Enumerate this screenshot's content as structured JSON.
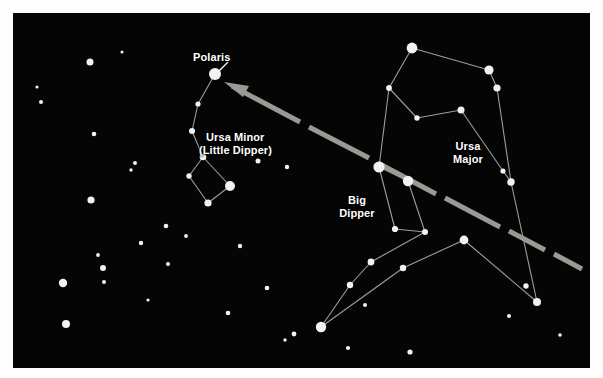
{
  "figure": {
    "type": "star-chart",
    "title_visible": false,
    "background_color": "#050505",
    "page_color": "#fdfdfb",
    "star_color": "#f2f2f0",
    "line_color": "#b9b9b4",
    "pointer_color": "#9a9a95",
    "label_color": "#ffffff",
    "frame": {
      "x": 13,
      "y": 13,
      "width": 577,
      "height": 355
    }
  },
  "labels": [
    {
      "id": "polaris",
      "text": "Polaris",
      "x": 193,
      "y": 51,
      "align": "left"
    },
    {
      "id": "ursa-minor",
      "text": "Ursa Minor",
      "x": 206,
      "y": 131,
      "align": "left"
    },
    {
      "id": "little-dipper",
      "text": "(Little Dipper)",
      "x": 199,
      "y": 144,
      "align": "left"
    },
    {
      "id": "big-dipper-1",
      "text": "Big",
      "x": 357,
      "y": 194,
      "align": "center"
    },
    {
      "id": "big-dipper-2",
      "text": "Dipper",
      "x": 357,
      "y": 207,
      "align": "center"
    },
    {
      "id": "ursa-major-1",
      "text": "Ursa",
      "x": 468,
      "y": 140,
      "align": "center"
    },
    {
      "id": "ursa-major-2",
      "text": "Major",
      "x": 468,
      "y": 153,
      "align": "center"
    }
  ],
  "leader_lines": [
    {
      "id": "polaris-leader",
      "x1": 228,
      "y1": 62,
      "x2": 217,
      "y2": 73
    }
  ],
  "pointer_arrow": {
    "id": "pointer-line",
    "description": "dashed arrow from Big Dipper pointer stars to Polaris",
    "tip": {
      "x": 224,
      "y": 82
    },
    "tail": {
      "x": 578,
      "y": 268
    },
    "dashes": [
      {
        "x1": 232,
        "y1": 86,
        "x2": 300,
        "y2": 122
      },
      {
        "x1": 309,
        "y1": 127,
        "x2": 369,
        "y2": 158
      },
      {
        "x1": 378,
        "y1": 163,
        "x2": 436,
        "y2": 194
      },
      {
        "x1": 445,
        "y1": 198,
        "x2": 500,
        "y2": 227
      },
      {
        "x1": 509,
        "y1": 231,
        "x2": 545,
        "y2": 250
      },
      {
        "x1": 554,
        "y1": 254,
        "x2": 582,
        "y2": 269
      }
    ],
    "arrowhead": [
      {
        "x": 224,
        "y": 82
      },
      {
        "x": 249,
        "y": 86
      },
      {
        "x": 243,
        "y": 97
      }
    ]
  },
  "constellations": [
    {
      "name": "Ursa Minor (Little Dipper)",
      "stars": [
        {
          "name": "Polaris",
          "x": 215,
          "y": 74,
          "r": 6.0
        },
        {
          "name": "Yildun",
          "x": 198,
          "y": 104,
          "r": 2.6
        },
        {
          "name": "Epsilon UMi",
          "x": 192,
          "y": 131,
          "r": 3.0
        },
        {
          "name": "Zeta UMi",
          "x": 203,
          "y": 157,
          "r": 3.3
        },
        {
          "name": "Eta UMi",
          "x": 189,
          "y": 176,
          "r": 2.7
        },
        {
          "name": "Gamma UMi",
          "x": 208,
          "y": 203,
          "r": 3.6
        },
        {
          "name": "Kochab",
          "x": 230,
          "y": 186,
          "r": 5.0
        }
      ],
      "lines": [
        {
          "from": 0,
          "to": 1
        },
        {
          "from": 1,
          "to": 2
        },
        {
          "from": 2,
          "to": 3
        },
        {
          "from": 3,
          "to": 4
        },
        {
          "from": 4,
          "to": 5
        },
        {
          "from": 5,
          "to": 6
        },
        {
          "from": 6,
          "to": 3
        }
      ]
    },
    {
      "name": "Ursa Major (Big Dipper + body)",
      "stars": [
        {
          "name": "Dubhe",
          "x": 379,
          "y": 167,
          "r": 5.6
        },
        {
          "name": "Merak",
          "x": 408,
          "y": 181,
          "r": 5.2
        },
        {
          "name": "Phecda",
          "x": 395,
          "y": 229,
          "r": 3.1
        },
        {
          "name": "Megrez",
          "x": 425,
          "y": 232,
          "r": 3.0
        },
        {
          "name": "Alioth",
          "x": 371,
          "y": 262,
          "r": 3.4
        },
        {
          "name": "Mizar",
          "x": 350,
          "y": 285,
          "r": 3.2
        },
        {
          "name": "Alkaid",
          "x": 321,
          "y": 327,
          "r": 5.2
        },
        {
          "name": "Upsilon UMa",
          "x": 412,
          "y": 48,
          "r": 5.4
        },
        {
          "name": "Omicron UMa",
          "x": 389,
          "y": 88,
          "r": 2.9
        },
        {
          "name": "Theta UMa",
          "x": 417,
          "y": 118,
          "r": 2.7
        },
        {
          "name": "Psi UMa",
          "x": 461,
          "y": 110,
          "r": 3.5
        },
        {
          "name": "Chi UMa",
          "x": 489,
          "y": 70,
          "r": 4.6
        },
        {
          "name": "Nu UMa",
          "x": 497,
          "y": 88,
          "r": 3.6
        },
        {
          "name": "Xi UMa",
          "x": 503,
          "y": 171,
          "r": 2.6
        },
        {
          "name": "Tania UMa",
          "x": 511,
          "y": 182,
          "r": 3.7
        },
        {
          "name": "Talitha",
          "x": 464,
          "y": 240,
          "r": 4.4
        },
        {
          "name": "Iota UMa",
          "x": 403,
          "y": 268,
          "r": 3.2
        },
        {
          "name": "Mu UMa",
          "x": 526,
          "y": 286,
          "r": 2.7
        },
        {
          "name": "Lambda UMa",
          "x": 537,
          "y": 302,
          "r": 4.0
        }
      ],
      "lines": [
        {
          "from": 0,
          "to": 1
        },
        {
          "from": 1,
          "to": 3
        },
        {
          "from": 3,
          "to": 2
        },
        {
          "from": 2,
          "to": 0
        },
        {
          "from": 3,
          "to": 4
        },
        {
          "from": 4,
          "to": 5
        },
        {
          "from": 5,
          "to": 6
        },
        {
          "from": 0,
          "to": 8
        },
        {
          "from": 8,
          "to": 7
        },
        {
          "from": 7,
          "to": 11
        },
        {
          "from": 11,
          "to": 12
        },
        {
          "from": 8,
          "to": 9
        },
        {
          "from": 9,
          "to": 10
        },
        {
          "from": 10,
          "to": 13
        },
        {
          "from": 12,
          "to": 14
        },
        {
          "from": 13,
          "to": 14
        },
        {
          "from": 14,
          "to": 18
        },
        {
          "from": 15,
          "to": 16
        },
        {
          "from": 16,
          "to": 6
        },
        {
          "from": 15,
          "to": 18
        }
      ]
    }
  ],
  "background_stars": [
    {
      "x": 37,
      "y": 87,
      "r": 1.6
    },
    {
      "x": 41,
      "y": 102,
      "r": 2.0
    },
    {
      "x": 90,
      "y": 62,
      "r": 3.5
    },
    {
      "x": 94,
      "y": 134,
      "r": 2.3
    },
    {
      "x": 91,
      "y": 200,
      "r": 3.6
    },
    {
      "x": 135,
      "y": 163,
      "r": 2.0
    },
    {
      "x": 131,
      "y": 170,
      "r": 1.7
    },
    {
      "x": 141,
      "y": 243,
      "r": 2.2
    },
    {
      "x": 63,
      "y": 283,
      "r": 4.2
    },
    {
      "x": 104,
      "y": 282,
      "r": 2.0
    },
    {
      "x": 98,
      "y": 255,
      "r": 1.9
    },
    {
      "x": 103,
      "y": 268,
      "r": 3.0
    },
    {
      "x": 66,
      "y": 324,
      "r": 4.0
    },
    {
      "x": 166,
      "y": 226,
      "r": 2.3
    },
    {
      "x": 168,
      "y": 264,
      "r": 2.0
    },
    {
      "x": 186,
      "y": 236,
      "r": 1.9
    },
    {
      "x": 258,
      "y": 161,
      "r": 2.5
    },
    {
      "x": 287,
      "y": 167,
      "r": 2.2
    },
    {
      "x": 240,
      "y": 246,
      "r": 2.2
    },
    {
      "x": 267,
      "y": 288,
      "r": 2.3
    },
    {
      "x": 228,
      "y": 313,
      "r": 2.3
    },
    {
      "x": 294,
      "y": 334,
      "r": 2.4
    },
    {
      "x": 285,
      "y": 340,
      "r": 1.7
    },
    {
      "x": 348,
      "y": 348,
      "r": 2.1
    },
    {
      "x": 410,
      "y": 352,
      "r": 2.6
    },
    {
      "x": 365,
      "y": 305,
      "r": 2.0
    },
    {
      "x": 509,
      "y": 316,
      "r": 2.0
    },
    {
      "x": 560,
      "y": 335,
      "r": 1.8
    },
    {
      "x": 122,
      "y": 52,
      "r": 1.5
    },
    {
      "x": 148,
      "y": 300,
      "r": 1.6
    }
  ]
}
